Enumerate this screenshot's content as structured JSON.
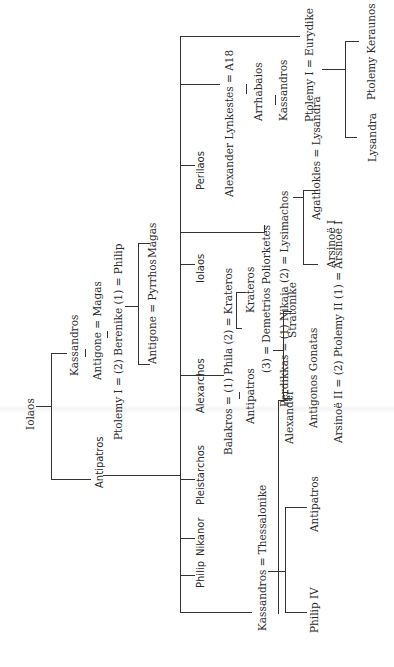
{
  "diagram": {
    "type": "genealogical-tree",
    "orientation": "rotated-90-ccw",
    "people": {
      "iolaos_root": "Iolaos",
      "kassandros_gen1": "Kassandros",
      "antipatros_gen1": "Antipatros",
      "antigone_magas": "Antigone = Magas",
      "ptolemy_berenike_philip": "Ptolemy I = (2) Berenike (1) = Philip",
      "antigone_pyrrhos": "Antigone = Pyrrhos",
      "magas_child": "Magas",
      "kassandros_thessalonike": "Kassandros = Thessalonike",
      "philip_child": "Philip",
      "nikanor": "Nikanor",
      "pleistarchos": "Pleistarchos",
      "alexarchos": "Alexarchos",
      "balakros_phila_krateros": "Balakros = (1) Phila (2) = Krateros",
      "antipatros_son_balakros": "Antipatros",
      "krateros_son": "Krateros",
      "iolaos_son": "Iolaos",
      "demetrios": "(3) = Demetrios Poliorketes",
      "perdikkas_nikaia_lysimachos": "Perdikkas = (1) Nikaia (2) = Lysimachos",
      "perilaos": "Perilaos",
      "alexander_lynkestes": "Alexander Lynkestes = A18",
      "arrhabaios": "Arrhabaios",
      "kassandros_son_arrhabaios": "Kassandros",
      "ptolemy_eurydike": "Ptolemy I = Eurydike",
      "lysandra": "Lysandra",
      "ptolemy_keraunos": "Ptolemy Keraunos",
      "agathokles_lysandra": "Agathokles = Lysandra",
      "arsinoe_i": "Arsinoë I",
      "arsinoe_ptolemy_arsinoe": "Arsinoë II = (2) Ptolemy II (1) = Arsinoë I",
      "antigonos_gonatas": "Antigonos Gonatas",
      "stratonike": "Stratonike",
      "alexander_son": "Alexander",
      "antipatros_son_kassandros": "Antipatros",
      "philip_iv": "Philip IV"
    }
  }
}
